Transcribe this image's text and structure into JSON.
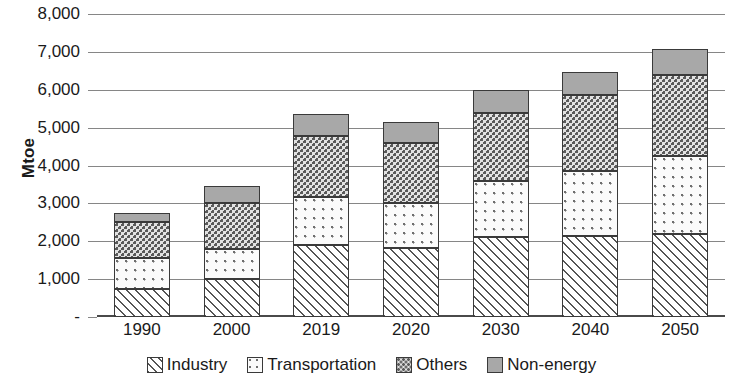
{
  "chart_data": {
    "type": "bar",
    "stacked": true,
    "title": "",
    "xlabel": "",
    "ylabel": "Mtoe",
    "ylim": [
      0,
      8000
    ],
    "ytick_values": [
      0,
      1000,
      2000,
      3000,
      4000,
      5000,
      6000,
      7000,
      8000
    ],
    "ytick_labels": [
      "-",
      "1,000",
      "2,000",
      "3,000",
      "4,000",
      "5,000",
      "6,000",
      "7,000",
      "8,000"
    ],
    "grid": true,
    "legend_position": "bottom",
    "categories": [
      "1990",
      "2000",
      "2019",
      "2020",
      "2030",
      "2040",
      "2050"
    ],
    "series": [
      {
        "name": "Industry",
        "pattern": "diagonal-hatch",
        "color": "#ffffff",
        "values": [
          750,
          1000,
          1900,
          1830,
          2100,
          2150,
          2200
        ]
      },
      {
        "name": "Transportation",
        "pattern": "sparse-dots",
        "color": "#fbfbfb",
        "values": [
          800,
          800,
          1280,
          1170,
          1500,
          1700,
          2050
        ]
      },
      {
        "name": "Others",
        "pattern": "dense-dots",
        "color": "#e2e2e2",
        "values": [
          950,
          1200,
          1590,
          1600,
          1790,
          2020,
          2130
        ]
      },
      {
        "name": "Non-energy",
        "pattern": "solid-gray",
        "color": "#a8a8a8",
        "values": [
          250,
          450,
          580,
          550,
          600,
          610,
          700
        ]
      }
    ],
    "totals": [
      2750,
      3450,
      5350,
      5150,
      6000,
      6500,
      7100
    ]
  }
}
